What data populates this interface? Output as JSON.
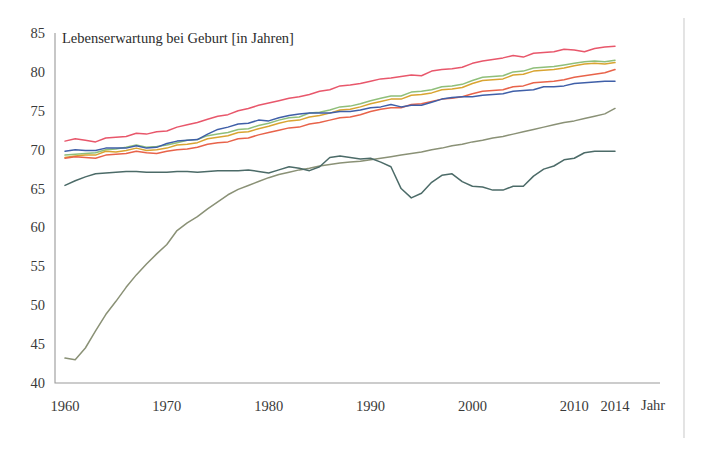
{
  "chart_data": {
    "type": "line",
    "title": "Lebenserwartung bei Geburt [in Jahren]",
    "xlabel": "Jahr",
    "ylabel": "",
    "xlim": [
      1960,
      2014
    ],
    "ylim": [
      40,
      85
    ],
    "grid": false,
    "legend": "none",
    "xticks": [
      "1960",
      "1970",
      "1980",
      "1990",
      "2000",
      "2010",
      "2014"
    ],
    "xtick_values": [
      1960,
      1970,
      1980,
      1990,
      2000,
      2010,
      2014
    ],
    "yticks": [
      "40",
      "45",
      "50",
      "55",
      "60",
      "65",
      "70",
      "75",
      "80",
      "85"
    ],
    "ytick_values": [
      40,
      45,
      50,
      55,
      60,
      65,
      70,
      75,
      80,
      85
    ],
    "x": [
      1960,
      1961,
      1962,
      1963,
      1964,
      1965,
      1966,
      1967,
      1968,
      1969,
      1970,
      1971,
      1972,
      1973,
      1974,
      1975,
      1976,
      1977,
      1978,
      1979,
      1980,
      1981,
      1982,
      1983,
      1984,
      1985,
      1986,
      1987,
      1988,
      1989,
      1990,
      1991,
      1992,
      1993,
      1994,
      1995,
      1996,
      1997,
      1998,
      1999,
      2000,
      2001,
      2002,
      2003,
      2004,
      2005,
      2006,
      2007,
      2008,
      2009,
      2010,
      2011,
      2012,
      2013,
      2014
    ],
    "series": [
      {
        "name": "series-1",
        "color": "#e8576b",
        "values": [
          71.1,
          71.4,
          71.2,
          71.0,
          71.5,
          71.6,
          71.7,
          72.1,
          72.0,
          72.3,
          72.4,
          72.9,
          73.2,
          73.5,
          73.9,
          74.3,
          74.5,
          75.0,
          75.3,
          75.7,
          76.0,
          76.3,
          76.6,
          76.8,
          77.1,
          77.5,
          77.7,
          78.2,
          78.3,
          78.5,
          78.8,
          79.1,
          79.2,
          79.4,
          79.6,
          79.5,
          80.1,
          80.3,
          80.4,
          80.6,
          81.1,
          81.4,
          81.6,
          81.8,
          82.1,
          81.9,
          82.4,
          82.5,
          82.6,
          82.9,
          82.8,
          82.6,
          83.0,
          83.2,
          83.3
        ]
      },
      {
        "name": "series-2",
        "color": "#8fbf7a",
        "values": [
          69.3,
          69.4,
          69.5,
          69.6,
          70.0,
          70.1,
          70.3,
          70.6,
          70.3,
          70.4,
          70.6,
          70.9,
          71.2,
          71.3,
          71.8,
          72.0,
          72.2,
          72.6,
          72.7,
          73.1,
          73.4,
          73.8,
          74.1,
          74.2,
          74.7,
          74.8,
          75.1,
          75.5,
          75.6,
          75.9,
          76.3,
          76.6,
          76.9,
          76.9,
          77.4,
          77.5,
          77.7,
          78.1,
          78.2,
          78.4,
          78.9,
          79.3,
          79.4,
          79.5,
          80.0,
          80.1,
          80.5,
          80.6,
          80.7,
          80.9,
          81.1,
          81.3,
          81.4,
          81.3,
          81.5
        ]
      },
      {
        "name": "series-3",
        "color": "#d9a431",
        "values": [
          69.0,
          69.2,
          69.3,
          69.3,
          69.8,
          69.7,
          69.9,
          70.2,
          69.9,
          70.0,
          70.2,
          70.6,
          70.7,
          70.9,
          71.4,
          71.6,
          71.8,
          72.2,
          72.3,
          72.7,
          73.0,
          73.4,
          73.7,
          73.8,
          74.2,
          74.4,
          74.7,
          75.1,
          75.2,
          75.5,
          75.9,
          76.2,
          76.5,
          76.5,
          77.0,
          77.1,
          77.3,
          77.7,
          77.8,
          78.0,
          78.5,
          78.9,
          79.0,
          79.1,
          79.6,
          79.7,
          80.1,
          80.2,
          80.3,
          80.5,
          80.8,
          81.0,
          81.1,
          81.0,
          81.2
        ]
      },
      {
        "name": "series-4",
        "color": "#e8634a",
        "values": [
          68.9,
          69.1,
          69.0,
          68.9,
          69.3,
          69.4,
          69.5,
          69.8,
          69.6,
          69.5,
          69.8,
          70.0,
          70.1,
          70.3,
          70.7,
          70.9,
          71.0,
          71.4,
          71.5,
          71.9,
          72.2,
          72.5,
          72.8,
          72.9,
          73.3,
          73.5,
          73.8,
          74.1,
          74.2,
          74.5,
          74.9,
          75.2,
          75.4,
          75.4,
          75.8,
          75.9,
          76.2,
          76.5,
          76.6,
          76.8,
          77.2,
          77.5,
          77.6,
          77.7,
          78.1,
          78.2,
          78.6,
          78.7,
          78.8,
          79.0,
          79.3,
          79.5,
          79.7,
          79.9,
          80.3
        ]
      },
      {
        "name": "series-5",
        "color": "#3f5fa8",
        "values": [
          69.8,
          70.0,
          69.9,
          69.9,
          70.2,
          70.2,
          70.2,
          70.5,
          70.2,
          70.3,
          70.8,
          71.1,
          71.2,
          71.3,
          72.0,
          72.6,
          72.9,
          73.3,
          73.4,
          73.8,
          73.7,
          74.1,
          74.4,
          74.6,
          74.7,
          74.7,
          74.7,
          74.9,
          74.9,
          75.1,
          75.4,
          75.5,
          75.8,
          75.5,
          75.7,
          75.7,
          76.1,
          76.5,
          76.7,
          76.8,
          76.8,
          77.0,
          77.1,
          77.2,
          77.5,
          77.6,
          77.7,
          78.1,
          78.1,
          78.2,
          78.5,
          78.6,
          78.7,
          78.8,
          78.8
        ]
      },
      {
        "name": "series-6",
        "color": "#8a9176",
        "values": [
          43.2,
          43.0,
          44.5,
          46.7,
          48.8,
          50.5,
          52.3,
          53.9,
          55.3,
          56.6,
          57.8,
          59.6,
          60.6,
          61.4,
          62.4,
          63.3,
          64.2,
          64.9,
          65.4,
          65.9,
          66.4,
          66.8,
          67.1,
          67.4,
          67.6,
          67.9,
          68.1,
          68.3,
          68.4,
          68.5,
          68.7,
          68.9,
          69.1,
          69.3,
          69.5,
          69.7,
          70.0,
          70.2,
          70.5,
          70.7,
          71.0,
          71.2,
          71.5,
          71.7,
          72.0,
          72.3,
          72.6,
          72.9,
          73.2,
          73.5,
          73.7,
          74.0,
          74.3,
          74.6,
          75.3
        ]
      },
      {
        "name": "series-7",
        "color": "#4c6b68",
        "values": [
          65.4,
          66.0,
          66.5,
          66.9,
          67.0,
          67.1,
          67.2,
          67.2,
          67.1,
          67.1,
          67.1,
          67.2,
          67.2,
          67.1,
          67.2,
          67.3,
          67.3,
          67.3,
          67.4,
          67.2,
          67.0,
          67.4,
          67.8,
          67.6,
          67.3,
          67.8,
          69.0,
          69.2,
          69.0,
          68.8,
          68.9,
          68.4,
          67.8,
          65.0,
          63.8,
          64.4,
          65.8,
          66.7,
          66.9,
          65.9,
          65.3,
          65.2,
          64.8,
          64.8,
          65.3,
          65.3,
          66.6,
          67.5,
          67.9,
          68.7,
          68.9,
          69.6,
          69.8,
          69.8,
          69.8
        ]
      }
    ]
  },
  "axes": {
    "x_axis_name": "Jahr"
  }
}
